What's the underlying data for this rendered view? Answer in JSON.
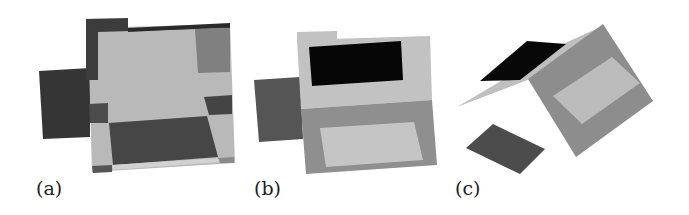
{
  "figure": {
    "panels": [
      {
        "id": "a",
        "label": "(a)",
        "description": "Top-down projection of unfolded box net with dark side flaps"
      },
      {
        "id": "b",
        "label": "(b)",
        "description": "Flat box net with black lid region, gray base and light inner rectangle"
      },
      {
        "id": "c",
        "label": "(c)",
        "description": "Partially folded box net in 3D perspective"
      }
    ]
  },
  "colors": {
    "background": "#ffffff",
    "light_gray": "#b9b9b9",
    "mid_gray": "#858585",
    "dark_gray": "#4a4a4a",
    "darker_gray": "#353535",
    "black": "#0a0a0a",
    "pale_gray": "#cfcfcf"
  }
}
